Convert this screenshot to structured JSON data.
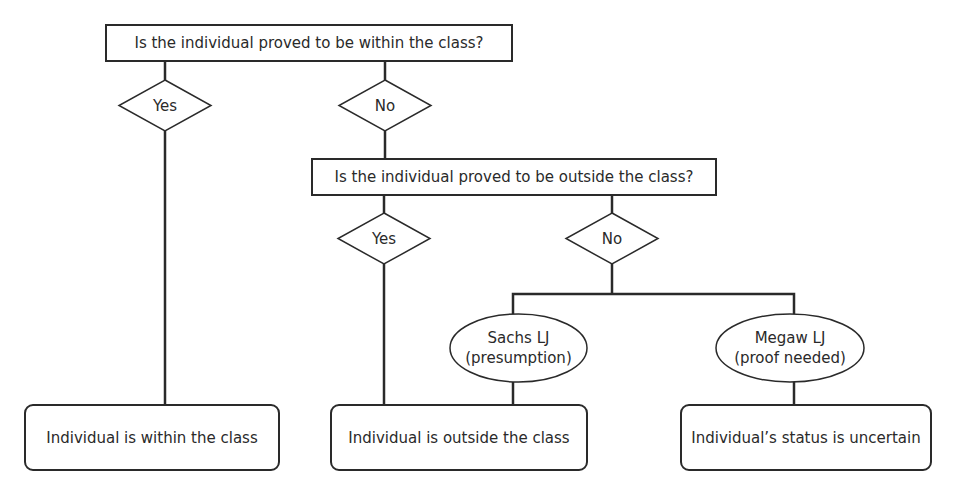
{
  "diagram": {
    "question_1": "Is the individual proved to be within the class?",
    "q1_yes": "Yes",
    "q1_no": "No",
    "question_2": "Is the individual proved to be outside the class?",
    "q2_yes": "Yes",
    "q2_no": "No",
    "opinion_sachs": {
      "line1": "Sachs LJ",
      "line2": "(presumption)"
    },
    "opinion_megaw": {
      "line1": "Megaw LJ",
      "line2": "(proof needed)"
    },
    "outcome_within": "Individual is within the class",
    "outcome_outside": "Individual is outside the class",
    "outcome_uncertain": "Individual’s status is uncertain"
  },
  "colors": {
    "stroke": "#2a2a2a",
    "background": "#ffffff"
  }
}
